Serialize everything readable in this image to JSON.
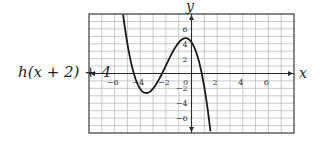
{
  "chart_data": {
    "type": "line",
    "title": "",
    "function_label": "h(x + 2) + 4",
    "xlabel": "x",
    "ylabel": "y",
    "xlim": [
      -8,
      8
    ],
    "ylim": [
      -8,
      8
    ],
    "grid": true,
    "grid_step": 1,
    "x_ticks": [
      -6,
      -4,
      -2,
      0,
      2,
      4,
      6
    ],
    "x_tick_labels": [
      "−6",
      "−4",
      "−2",
      "0",
      "2",
      "4",
      "6"
    ],
    "y_ticks": [
      6,
      4,
      2,
      -2,
      -4,
      -6
    ],
    "y_tick_labels": [
      "6",
      "4",
      "2",
      "−2",
      "−4",
      "−6"
    ],
    "series": [
      {
        "name": "h(x + 2) + 4",
        "kind": "cubic",
        "roots": [
          -4.5,
          -2.3,
          0.8
        ],
        "leading_coefficient": -0.507,
        "key_points": {
          "y_intercept": [
            0,
            4.2
          ],
          "local_min": [
            -3.5,
            -2.4
          ],
          "local_max": [
            -0.5,
            4.6
          ],
          "x_intercepts": [
            -4.5,
            -2.3,
            0.8
          ]
        },
        "x": [
          -5.35,
          -5,
          -4.5,
          -4,
          -3.5,
          -3,
          -2.3,
          -2,
          -1.5,
          -1,
          -0.5,
          0,
          0.5,
          0.8,
          1,
          1.5
        ],
        "y": [
          7.9,
          5.3,
          0,
          -1.9,
          -2.6,
          -2.0,
          0,
          1.4,
          3.3,
          4.5,
          4.7,
          4.2,
          2.5,
          0,
          -1.6,
          -8.1
        ]
      }
    ],
    "colors": {
      "curve": "#1a1a1a",
      "axis": "#2a2a2a",
      "grid": "#bdbdbd",
      "frame": "#3a3a3a"
    }
  }
}
